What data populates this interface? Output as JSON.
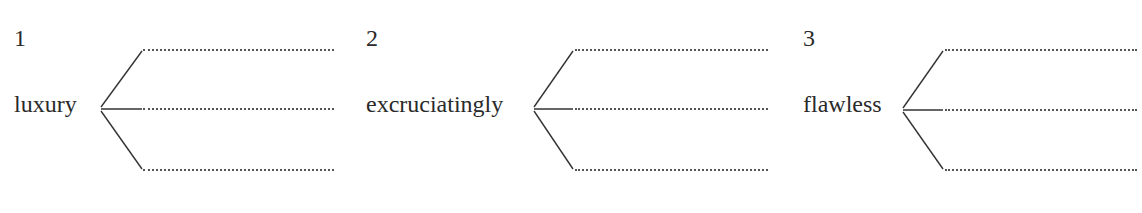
{
  "exercise": {
    "items": [
      {
        "number": "1",
        "word": "luxury",
        "blanks": [
          "",
          "",
          ""
        ]
      },
      {
        "number": "2",
        "word": "excruciatingly",
        "blanks": [
          "",
          "",
          ""
        ]
      },
      {
        "number": "3",
        "word": "flawless",
        "blanks": [
          "",
          "",
          ""
        ]
      }
    ]
  }
}
